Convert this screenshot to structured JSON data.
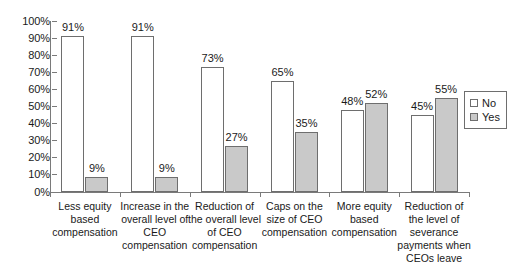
{
  "chart_data": {
    "type": "bar",
    "title": "",
    "subtitle": "",
    "xlabel": "",
    "ylabel": "",
    "ylim": [
      0,
      100
    ],
    "grid": false,
    "legend_position": "right",
    "y_ticks": [
      "0%",
      "10%",
      "20%",
      "30%",
      "40%",
      "50%",
      "60%",
      "70%",
      "80%",
      "90%",
      "100%"
    ],
    "categories": [
      "Less equity based compensation",
      "Increase in the overall level of CEO compensation",
      "Reduction of the overall level of CEO compensation",
      "Caps on the size of CEO compensation",
      "More equity based compensation",
      "Reduction of the level of severance payments when CEOs leave"
    ],
    "category_lines": [
      [
        "Less equity",
        "based",
        "compensation"
      ],
      [
        "Increase in the",
        "overall level of",
        "CEO",
        "compensation"
      ],
      [
        "Reduction of",
        "the overall level",
        "of CEO",
        "compensation"
      ],
      [
        "Caps on the",
        "size of CEO",
        "compensation"
      ],
      [
        "More equity",
        "based",
        "compensation"
      ],
      [
        "Reduction of",
        "the level of",
        "severance",
        "payments when",
        "CEOs leave"
      ]
    ],
    "series": [
      {
        "name": "No",
        "color": "#ffffff",
        "values": [
          91,
          91,
          73,
          65,
          48,
          45
        ],
        "labels": [
          "91%",
          "91%",
          "73%",
          "65%",
          "48%",
          "45%"
        ]
      },
      {
        "name": "Yes",
        "color": "#c9c9c9",
        "values": [
          9,
          9,
          27,
          35,
          52,
          55
        ],
        "labels": [
          "9%",
          "9%",
          "27%",
          "35%",
          "52%",
          "55%"
        ]
      }
    ]
  },
  "legend": {
    "items": [
      {
        "label": "No"
      },
      {
        "label": "Yes"
      }
    ]
  }
}
